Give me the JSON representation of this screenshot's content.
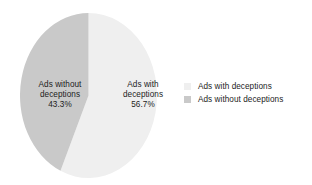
{
  "chart_data": {
    "type": "pie",
    "title": "",
    "subtitle": "",
    "xlabel": "",
    "ylabel": "",
    "grid": false,
    "legend_position": "right",
    "start_angle_deg": 0,
    "direction": "clockwise",
    "categories": [
      "Ads with deceptions",
      "Ads without deceptions"
    ],
    "values": [
      56.7,
      43.3
    ],
    "value_unit": "%",
    "colors": [
      "#efefef",
      "#c9c9c9"
    ],
    "slices": [
      {
        "name": "Ads with deceptions",
        "label_line1": "Ads with",
        "label_line2": "deceptions",
        "value": 56.7,
        "value_label": "56.7%",
        "color": "#efefef"
      },
      {
        "name": "Ads without deceptions",
        "label_line1": "Ads without",
        "label_line2": "deceptions",
        "value": 43.3,
        "value_label": "43.3%",
        "color": "#c9c9c9"
      }
    ],
    "legend": [
      {
        "label": "Ads with deceptions",
        "color": "#efefef"
      },
      {
        "label": "Ads without deceptions",
        "color": "#c9c9c9"
      }
    ]
  },
  "figure": {
    "background": "#ffffff",
    "text_color": "#1c1c1c"
  }
}
